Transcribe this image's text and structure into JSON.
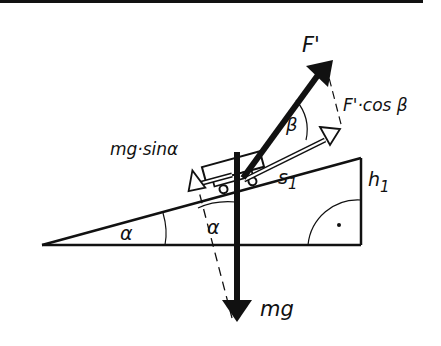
{
  "diagram": {
    "type": "inclined-plane-force-diagram",
    "colors": {
      "ink": "#111111",
      "background": "#ffffff"
    },
    "labels": {
      "applied_force": "F'",
      "force_component": "F'·cos β",
      "downhill_component": "mg·sinα",
      "weight": "mg",
      "slope_length": "s",
      "slope_length_sub": "1",
      "height": "h",
      "height_sub": "1",
      "angle_alpha_base": "α",
      "angle_alpha_weight": "α",
      "angle_beta": "β",
      "right_angle_mark": "·"
    }
  }
}
